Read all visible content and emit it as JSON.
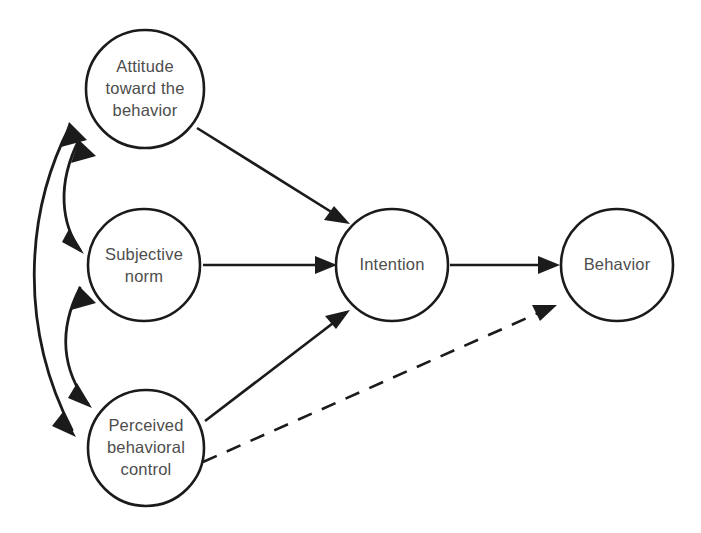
{
  "diagram": {
    "type": "flow-diagram",
    "background_color": "#ffffff",
    "stroke_color": "#1b1b1b",
    "label_color": "#4d4d4d",
    "nodes": [
      {
        "id": "attitude",
        "label_lines": [
          "Attitude",
          "toward the",
          "behavior"
        ],
        "line1": "Attitude",
        "line2": "toward the",
        "line3": "behavior",
        "shape": "circle",
        "cx": 145,
        "cy": 89,
        "r": 59
      },
      {
        "id": "subjective-norm",
        "label_lines": [
          "Subjective",
          "norm"
        ],
        "line1": "Subjective",
        "line2": "norm",
        "shape": "circle",
        "cx": 144,
        "cy": 265,
        "r": 56
      },
      {
        "id": "perceived-behavioral-control",
        "label_lines": [
          "Perceived",
          "behavioral",
          "control"
        ],
        "line1": "Perceived",
        "line2": "behavioral",
        "line3": "control",
        "shape": "circle",
        "cx": 146,
        "cy": 448,
        "r": 58
      },
      {
        "id": "intention",
        "label_lines": [
          "Intention"
        ],
        "line1": "Intention",
        "shape": "circle",
        "cx": 392,
        "cy": 265,
        "r": 56
      },
      {
        "id": "behavior",
        "label_lines": [
          "Behavior"
        ],
        "line1": "Behavior",
        "shape": "circle",
        "cx": 617,
        "cy": 265,
        "r": 56
      }
    ],
    "edges": [
      {
        "id": "attitude-to-intention",
        "from": "attitude",
        "to": "intention",
        "style": "solid",
        "direction": "one-way"
      },
      {
        "id": "subjective-norm-to-intention",
        "from": "subjective-norm",
        "to": "intention",
        "style": "solid",
        "direction": "one-way"
      },
      {
        "id": "pbc-to-intention",
        "from": "perceived-behavioral-control",
        "to": "intention",
        "style": "solid",
        "direction": "one-way"
      },
      {
        "id": "intention-to-behavior",
        "from": "intention",
        "to": "behavior",
        "style": "solid",
        "direction": "one-way"
      },
      {
        "id": "pbc-to-behavior",
        "from": "perceived-behavioral-control",
        "to": "behavior",
        "style": "dashed",
        "direction": "one-way"
      },
      {
        "id": "attitude-subjective-norm-correlation",
        "from": "attitude",
        "to": "subjective-norm",
        "style": "curved",
        "direction": "two-way"
      },
      {
        "id": "subjective-norm-pbc-correlation",
        "from": "subjective-norm",
        "to": "perceived-behavioral-control",
        "style": "curved",
        "direction": "two-way"
      },
      {
        "id": "attitude-pbc-correlation",
        "from": "attitude",
        "to": "perceived-behavioral-control",
        "style": "curved",
        "direction": "two-way"
      }
    ]
  }
}
